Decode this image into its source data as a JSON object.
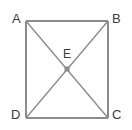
{
  "figure": {
    "type": "geometry-diagram",
    "background_color": "#ffffff",
    "stroke_color": "#8c8c8c",
    "label_color": "#3b3b3b",
    "point_marker_color": "#8c8c8c",
    "vertices": [
      {
        "id": "A",
        "label": "A",
        "x": 26,
        "y": 21,
        "label_x": 12,
        "label_y": 12
      },
      {
        "id": "B",
        "label": "B",
        "x": 108,
        "y": 21,
        "label_x": 112,
        "label_y": 12
      },
      {
        "id": "C",
        "label": "C",
        "x": 108,
        "y": 118,
        "label_x": 112,
        "label_y": 108
      },
      {
        "id": "D",
        "label": "D",
        "x": 26,
        "y": 118,
        "label_x": 11,
        "label_y": 108
      },
      {
        "id": "E",
        "label": "E",
        "x": 67,
        "y": 69,
        "label_x": 63,
        "label_y": 48
      }
    ],
    "sides": [
      {
        "id": "AB",
        "from": "A",
        "to": "B"
      },
      {
        "id": "BC",
        "from": "B",
        "to": "C"
      },
      {
        "id": "CD",
        "from": "C",
        "to": "D"
      },
      {
        "id": "DA",
        "from": "D",
        "to": "A"
      }
    ],
    "diagonals": [
      {
        "id": "AC",
        "from": "A",
        "to": "C"
      },
      {
        "id": "BD",
        "from": "B",
        "to": "D"
      }
    ],
    "point_marker": {
      "id": "E",
      "shape": "square",
      "x": 67,
      "y": 69,
      "size": 5
    }
  }
}
